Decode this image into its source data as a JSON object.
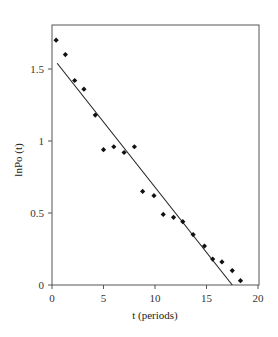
{
  "chart_data": {
    "type": "scatter",
    "title": "",
    "xlabel": "t (periods)",
    "ylabel": "lnPo (t)",
    "xlim": [
      0,
      20
    ],
    "ylim": [
      0,
      1.75
    ],
    "xticks": [
      0,
      5,
      10,
      15,
      20
    ],
    "yticks": [
      0,
      0.5,
      1,
      1.5
    ],
    "xtick_labels": [
      "0",
      "5",
      "10",
      "15",
      "20"
    ],
    "ytick_labels": [
      "0",
      "0.5",
      "1",
      "1.5"
    ],
    "grid": false,
    "legend": null,
    "series": [
      {
        "name": "observations",
        "kind": "scatter",
        "marker": "diamond",
        "x": [
          0.4,
          1.3,
          2.2,
          3.1,
          4.2,
          5.0,
          6.0,
          7.0,
          8.0,
          8.8,
          9.9,
          10.8,
          11.8,
          12.7,
          13.7,
          14.8,
          15.6,
          16.5,
          17.5,
          18.3
        ],
        "y": [
          1.7,
          1.6,
          1.42,
          1.36,
          1.18,
          0.94,
          0.96,
          0.92,
          0.96,
          0.65,
          0.62,
          0.49,
          0.47,
          0.44,
          0.35,
          0.27,
          0.18,
          0.16,
          0.1,
          0.03
        ]
      },
      {
        "name": "fitted line",
        "kind": "line",
        "x": [
          0.5,
          17.5
        ],
        "y": [
          1.54,
          0.0
        ]
      }
    ]
  }
}
